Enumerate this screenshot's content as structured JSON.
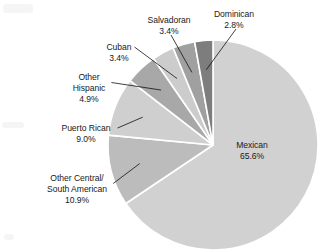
{
  "chart_data": {
    "type": "pie",
    "title": "",
    "subtitle": "",
    "xlabel": "",
    "ylabel": "",
    "legend_position": "none",
    "grid": false,
    "units": "percent",
    "total": 100.0,
    "categories": [
      "Mexican",
      "Other Central/ South American",
      "Puerto Rican",
      "Other Hispanic",
      "Cuban",
      "Salvadoran",
      "Dominican"
    ],
    "values": [
      65.6,
      10.9,
      9.0,
      4.9,
      3.4,
      3.4,
      2.8
    ],
    "slices": [
      {
        "name": "Mexican",
        "label_lines": [
          "Mexican"
        ],
        "value": 65.6,
        "value_label": "65.6%",
        "color": "#d1d1d1",
        "label_placement": "inside",
        "label_x": 252,
        "label_y": 148
      },
      {
        "name": "Other Central/South American",
        "label_lines": [
          "Other Central/",
          "South American"
        ],
        "value": 10.9,
        "value_label": "10.9%",
        "color": "#bcbcbc",
        "label_placement": "outside-left",
        "label_x": 77,
        "label_y": 181
      },
      {
        "name": "Puerto Rican",
        "label_lines": [
          "Puerto Rican"
        ],
        "value": 9.0,
        "value_label": "9.0%",
        "color": "#cfcfcf",
        "label_placement": "outside-left",
        "label_x": 86,
        "label_y": 131
      },
      {
        "name": "Other Hispanic",
        "label_lines": [
          "Other",
          "Hispanic"
        ],
        "value": 4.9,
        "value_label": "4.9%",
        "color": "#a8a8a8",
        "label_placement": "outside-left",
        "label_x": 89,
        "label_y": 80
      },
      {
        "name": "Cuban",
        "label_lines": [
          "Cuban"
        ],
        "value": 3.4,
        "value_label": "3.4%",
        "color": "#cccccc",
        "label_placement": "outside-left",
        "label_x": 119,
        "label_y": 50
      },
      {
        "name": "Salvadoran",
        "label_lines": [
          "Salvadoran"
        ],
        "value": 3.4,
        "value_label": "3.4%",
        "color": "#a0a0a0",
        "label_placement": "outside-top",
        "label_x": 169,
        "label_y": 23
      },
      {
        "name": "Dominican",
        "label_lines": [
          "Dominican"
        ],
        "value": 2.8,
        "value_label": "2.8%",
        "color": "#7d7d7d",
        "label_placement": "outside-top",
        "label_x": 234,
        "label_y": 17
      }
    ],
    "geometry": {
      "center_x": 213,
      "center_y": 145,
      "radius": 105,
      "start_angle_deg": -90,
      "direction": "clockwise",
      "gap_deg": 1.2
    },
    "colors": {
      "background": "#ffffff",
      "separator": "#ffffff",
      "text": "#1a1a1a",
      "leader_line": "#111111"
    }
  }
}
